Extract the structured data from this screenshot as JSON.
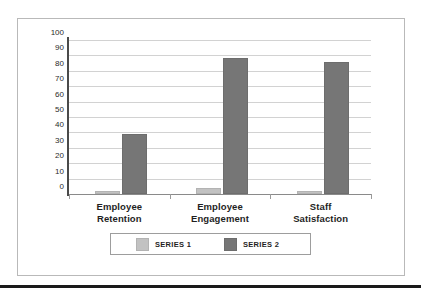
{
  "chart_data": {
    "type": "bar",
    "title": "",
    "subtitle": "",
    "xlabel": "",
    "ylabel": "",
    "categories": [
      "Employee Retention",
      "Employee Engagement",
      "Staff Satisfaction"
    ],
    "category_lines": [
      [
        "Employee",
        "Retention"
      ],
      [
        "Employee",
        "Engagement"
      ],
      [
        "Staff",
        "Satisfaction"
      ]
    ],
    "series": [
      {
        "name": "SERIES 1",
        "values": [
          2,
          4,
          2
        ],
        "color": "#c2c2c2"
      },
      {
        "name": "SERIES 2",
        "values": [
          39,
          88,
          86
        ],
        "color": "#767676"
      }
    ],
    "ylim": [
      0,
      100
    ],
    "ytick_step": 10,
    "yticks": [
      100,
      90,
      80,
      70,
      60,
      50,
      40,
      30,
      20,
      10,
      0
    ],
    "ytick_labels": [
      "100",
      "90",
      "80",
      "70",
      "60",
      "50",
      "40",
      "30",
      "20",
      "10",
      "0"
    ],
    "grid": true,
    "grid_axis": "y",
    "legend_position": "bottom",
    "legend_entries": [
      "SERIES 1",
      "SERIES 2"
    ]
  },
  "figure": {
    "border_color": "#b9b9b9",
    "background": "#ffffff",
    "rule_color": "#1a1a1a"
  }
}
